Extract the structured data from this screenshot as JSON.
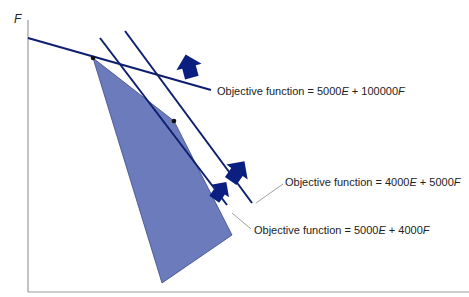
{
  "axes": {
    "y_label": "F",
    "x_label": ""
  },
  "colors": {
    "feasible_region": "#6b7bbb",
    "lines": "#0d1f6e",
    "arrows": "#0b1f80",
    "axis": "#999999"
  },
  "feasible_region": {
    "points": [
      [
        93,
        58
      ],
      [
        174,
        121
      ],
      [
        232,
        235
      ],
      [
        162,
        283
      ]
    ]
  },
  "objective_lines": [
    {
      "prefix": "Objective function = ",
      "e_coef": "5000",
      "e_var": "E",
      "plus": " + ",
      "f_coef": "100000",
      "f_var": "F"
    },
    {
      "prefix": "Objective function = ",
      "e_coef": "4000",
      "e_var": "E",
      "plus": " + ",
      "f_coef": "5000",
      "f_var": "F"
    },
    {
      "prefix": "Objective function = ",
      "e_coef": "5000",
      "e_var": "E",
      "plus": " + ",
      "f_coef": "4000",
      "f_var": "F"
    }
  ]
}
